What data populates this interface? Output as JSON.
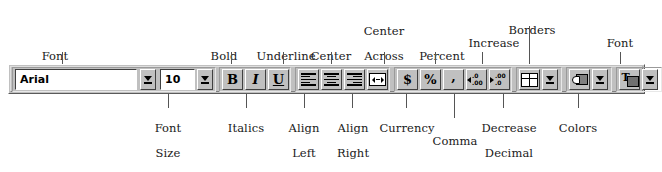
{
  "diagram": {
    "background": "#ffffff",
    "toolbar_face": "#c0c0c0"
  },
  "toolbar": {
    "font_name": {
      "value": "Arial",
      "placeholder": "Font",
      "dropdown_icon": "chevron-down-icon"
    },
    "font_size": {
      "value": "10",
      "placeholder": "Size",
      "dropdown_icon": "chevron-down-icon"
    },
    "buttons": {
      "bold": "B",
      "italic": "I",
      "underline": "U",
      "align_left": "align-left-icon",
      "align_center": "align-center-icon",
      "align_right": "align-right-icon",
      "center_across_columns": "center-across-columns-icon",
      "currency": "$",
      "percent": "%",
      "comma": ",",
      "increase_decimal": "increase-decimal-icon",
      "decrease_decimal": "decrease-decimal-icon",
      "borders": "borders-icon",
      "colors": "paint-bucket-icon",
      "font_color": "font-color-icon"
    },
    "decimal_glyphs": {
      "increase_top": ".0",
      "increase_bottom": ".00",
      "decrease_top": ".00",
      "decrease_bottom": ".0"
    }
  },
  "callouts": {
    "top": [
      {
        "id": "font",
        "lines": [
          "Font"
        ]
      },
      {
        "id": "bold",
        "lines": [
          "Bold"
        ]
      },
      {
        "id": "underline",
        "lines": [
          "Underline"
        ]
      },
      {
        "id": "center",
        "lines": [
          "Center"
        ]
      },
      {
        "id": "center-across-columns",
        "lines": [
          "Center",
          "Across",
          "Columns"
        ]
      },
      {
        "id": "percent",
        "lines": [
          "Percent"
        ]
      },
      {
        "id": "increase-decimal",
        "lines": [
          "Increase",
          "Decimal"
        ]
      },
      {
        "id": "borders",
        "lines": [
          "Borders"
        ]
      },
      {
        "id": "font-color",
        "lines": [
          "Font",
          "Color"
        ]
      }
    ],
    "bottom": [
      {
        "id": "font-size",
        "lines": [
          "Font",
          "Size"
        ]
      },
      {
        "id": "italics",
        "lines": [
          "Italics"
        ]
      },
      {
        "id": "align-left",
        "lines": [
          "Align",
          "Left"
        ]
      },
      {
        "id": "align-right",
        "lines": [
          "Align",
          "Right"
        ]
      },
      {
        "id": "currency",
        "lines": [
          "Currency"
        ]
      },
      {
        "id": "comma",
        "lines": [
          "Comma"
        ]
      },
      {
        "id": "decrease-decimal",
        "lines": [
          "Decrease",
          "Decimal"
        ]
      },
      {
        "id": "colors",
        "lines": [
          "Colors"
        ]
      }
    ]
  }
}
